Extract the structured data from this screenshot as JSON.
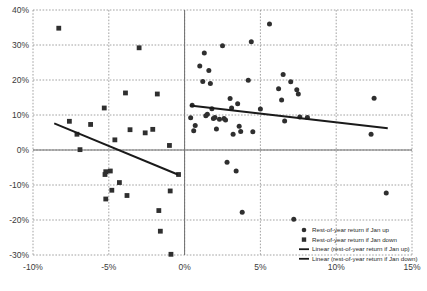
{
  "chart_data": {
    "type": "scatter",
    "title": "",
    "subtitle": "",
    "xlabel": "",
    "ylabel": "",
    "xlim": [
      -10,
      15
    ],
    "ylim": [
      -30,
      40
    ],
    "xticks": [
      -10,
      -5,
      0,
      5,
      10,
      15
    ],
    "yticks": [
      -30,
      -20,
      -10,
      0,
      10,
      20,
      30,
      40
    ],
    "xticklabels": [
      "-10%",
      "-5%",
      "0%",
      "5%",
      "10%",
      "15%"
    ],
    "yticklabels": [
      "-30%",
      "-20%",
      "-10%",
      "0%",
      "10%",
      "20%",
      "30%",
      "40%"
    ],
    "grid": true,
    "grid_style": "dotted",
    "legend_position": "lower-right",
    "axis_zero_lines": true,
    "marker_color": "#2f2f2f",
    "trendline_color": "#1a1a1a",
    "grid_color": "#8c8c8c",
    "axis_color": "#6e6e6e",
    "series": [
      {
        "name": "Rest-of-year return if Jan up",
        "marker": "circle",
        "color": "#2f2f2f",
        "points": [
          [
            0.4,
            9.2
          ],
          [
            0.5,
            12.8
          ],
          [
            0.6,
            5.5
          ],
          [
            0.7,
            7.0
          ],
          [
            1.0,
            24.0
          ],
          [
            1.2,
            19.6
          ],
          [
            1.3,
            27.7
          ],
          [
            1.4,
            9.8
          ],
          [
            1.5,
            10.2
          ],
          [
            1.6,
            22.7
          ],
          [
            1.7,
            19.0
          ],
          [
            1.8,
            11.8
          ],
          [
            1.9,
            9.0
          ],
          [
            2.0,
            9.3
          ],
          [
            2.1,
            6.0
          ],
          [
            2.3,
            8.8
          ],
          [
            2.5,
            29.8
          ],
          [
            2.6,
            9.0
          ],
          [
            2.7,
            8.6
          ],
          [
            2.8,
            -3.5
          ],
          [
            3.0,
            14.7
          ],
          [
            3.1,
            12.0
          ],
          [
            3.2,
            4.5
          ],
          [
            3.4,
            -6.0
          ],
          [
            3.5,
            13.2
          ],
          [
            3.6,
            6.8
          ],
          [
            3.7,
            5.3
          ],
          [
            3.8,
            -17.8
          ],
          [
            4.2,
            19.9
          ],
          [
            4.4,
            30.9
          ],
          [
            4.5,
            5.2
          ],
          [
            5.0,
            11.7
          ],
          [
            5.6,
            36.0
          ],
          [
            6.2,
            17.5
          ],
          [
            6.4,
            14.3
          ],
          [
            6.5,
            21.6
          ],
          [
            6.6,
            8.3
          ],
          [
            7.0,
            19.5
          ],
          [
            7.2,
            -19.8
          ],
          [
            7.4,
            17.2
          ],
          [
            7.5,
            16.0
          ],
          [
            7.6,
            9.4
          ],
          [
            8.1,
            9.3
          ],
          [
            12.3,
            4.5
          ],
          [
            12.5,
            14.8
          ],
          [
            13.3,
            -12.3
          ]
        ]
      },
      {
        "name": "Rest-of-year return if Jan down",
        "marker": "square",
        "color": "#2f2f2f",
        "points": [
          [
            -8.3,
            34.8
          ],
          [
            -7.6,
            8.2
          ],
          [
            -7.1,
            4.5
          ],
          [
            -6.9,
            0.1
          ],
          [
            -6.2,
            7.3
          ],
          [
            -5.3,
            12.0
          ],
          [
            -5.2,
            -6.2
          ],
          [
            -5.25,
            -7.0
          ],
          [
            -5.2,
            -14.0
          ],
          [
            -4.9,
            -6.0
          ],
          [
            -4.8,
            -11.5
          ],
          [
            -4.6,
            2.9
          ],
          [
            -4.3,
            -9.3
          ],
          [
            -3.9,
            16.3
          ],
          [
            -3.8,
            -13.0
          ],
          [
            -3.6,
            5.8
          ],
          [
            -3.0,
            29.2
          ],
          [
            -2.6,
            4.9
          ],
          [
            -2.1,
            5.9
          ],
          [
            -1.8,
            16.0
          ],
          [
            -1.7,
            -17.3
          ],
          [
            -1.6,
            -23.2
          ],
          [
            -1.0,
            1.3
          ],
          [
            -0.95,
            -11.7
          ],
          [
            -0.9,
            -29.8
          ],
          [
            -0.4,
            -7.0
          ]
        ]
      }
    ],
    "trendlines": [
      {
        "name": "Linear (rest-of-year return if Jan up)",
        "color": "#1a1a1a",
        "x0": 0.35,
        "y0": 12.7,
        "x1": 13.4,
        "y1": 6.2
      },
      {
        "name": "Linear (rest-of-year return if Jan down)",
        "color": "#1a1a1a",
        "x0": -8.6,
        "y0": 7.6,
        "x1": -0.45,
        "y1": -7.0
      }
    ],
    "legend": [
      {
        "label": "Rest-of-year return if Jan up",
        "marker": "circle"
      },
      {
        "label": "Rest-of-year return if Jan down",
        "marker": "square"
      },
      {
        "label": "Linear (rest-of-year return if Jan up)",
        "marker": "line"
      },
      {
        "label": "Linear (rest-of-year return if Jan down)",
        "marker": "line"
      }
    ]
  }
}
